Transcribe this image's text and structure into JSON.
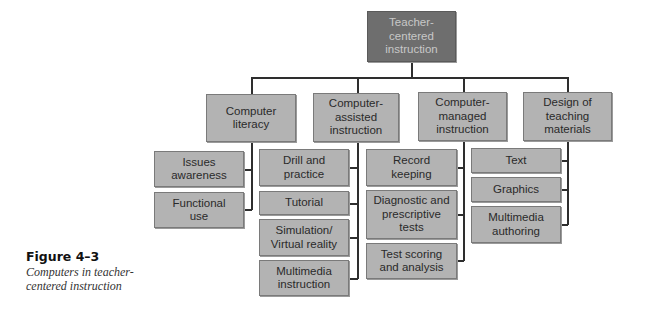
{
  "diagram": {
    "root": {
      "label": "Teacher-\ncentered\ninstruction"
    },
    "categories": [
      {
        "label": "Computer\nliteracy",
        "children": [
          "Issues\nawareness",
          "Functional\nuse"
        ]
      },
      {
        "label": "Computer-\nassisted\ninstruction",
        "children": [
          "Drill and\npractice",
          "Tutorial",
          "Simulation/\nVirtual reality",
          "Multimedia\ninstruction"
        ]
      },
      {
        "label": "Computer-\nmanaged\ninstruction",
        "children": [
          "Record\nkeeping",
          "Diagnostic and\nprescriptive\ntests",
          "Test scoring\nand analysis"
        ]
      },
      {
        "label": "Design of\nteaching\nmaterials",
        "children": [
          "Text",
          "Graphics",
          "Multimedia\nauthoring"
        ]
      }
    ]
  },
  "caption": {
    "title": "Figure 4–3",
    "text": "Computers in teacher-centered instruction"
  },
  "colors": {
    "root_fill": "#6e6e6e",
    "node_fill": "#b3b3b3",
    "line": "#2e2e2e"
  }
}
